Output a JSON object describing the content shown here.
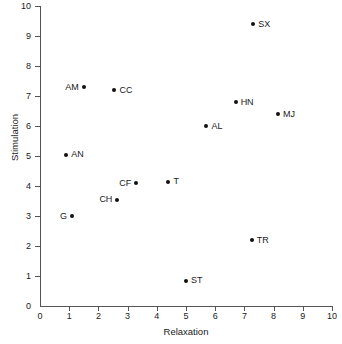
{
  "chart_data": {
    "type": "scatter",
    "title": "",
    "xlabel": "Relaxation",
    "ylabel": "Stimulation",
    "xlim": [
      0,
      10
    ],
    "ylim": [
      0,
      10
    ],
    "xticks": [
      0,
      1,
      2,
      3,
      4,
      5,
      6,
      7,
      8,
      9,
      10
    ],
    "yticks": [
      0,
      1,
      2,
      3,
      4,
      5,
      6,
      7,
      8,
      9,
      10
    ],
    "grid": false,
    "legend": "none",
    "marker_color": "#111111",
    "axis_color": "#555555",
    "points": [
      {
        "label": "SX",
        "x": 7.3,
        "y": 9.4,
        "label_side": "right"
      },
      {
        "label": "AM",
        "x": 1.5,
        "y": 7.3,
        "label_side": "left"
      },
      {
        "label": "CC",
        "x": 2.55,
        "y": 7.2,
        "label_side": "right"
      },
      {
        "label": "HN",
        "x": 6.7,
        "y": 6.8,
        "label_side": "right"
      },
      {
        "label": "MJ",
        "x": 8.15,
        "y": 6.4,
        "label_side": "right"
      },
      {
        "label": "AL",
        "x": 5.7,
        "y": 6.0,
        "label_side": "right"
      },
      {
        "label": "AN",
        "x": 0.9,
        "y": 5.05,
        "label_side": "right"
      },
      {
        "label": "CF",
        "x": 3.3,
        "y": 4.1,
        "label_side": "left"
      },
      {
        "label": "T",
        "x": 4.4,
        "y": 4.15,
        "label_side": "right"
      },
      {
        "label": "CH",
        "x": 2.65,
        "y": 3.55,
        "label_side": "left"
      },
      {
        "label": "G",
        "x": 1.1,
        "y": 3.0,
        "label_side": "left"
      },
      {
        "label": "TR",
        "x": 7.25,
        "y": 2.2,
        "label_side": "right"
      },
      {
        "label": "ST",
        "x": 5.0,
        "y": 0.85,
        "label_side": "right"
      }
    ]
  }
}
